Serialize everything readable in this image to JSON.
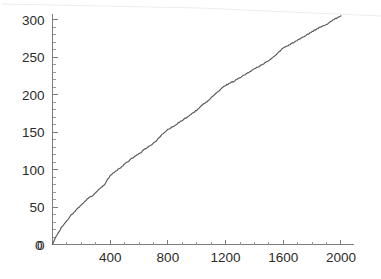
{
  "chart_data": {
    "type": "line",
    "title": "",
    "subtitle": "",
    "xlabel": "",
    "ylabel": "",
    "xlim": [
      0,
      2080
    ],
    "ylim": [
      0,
      318
    ],
    "grid": false,
    "legend": null,
    "xticks": [
      0,
      400,
      800,
      1200,
      1600,
      2000
    ],
    "xtick_labels": [
      "0",
      "400",
      "800",
      "1200",
      "1600",
      "2000"
    ],
    "yticks": [
      0,
      50,
      100,
      150,
      200,
      250,
      300
    ],
    "ytick_labels": [
      "0",
      "50",
      "100",
      "150",
      "200",
      "250",
      "300"
    ],
    "x_minor_tick_interval": 100,
    "y_minor_tick_interval": 10,
    "series": [
      {
        "name": "curve",
        "color": "#575757",
        "x": [
          0,
          20,
          40,
          60,
          80,
          100,
          120,
          140,
          160,
          180,
          200,
          240,
          280,
          320,
          360,
          400,
          440,
          480,
          520,
          560,
          600,
          640,
          680,
          720,
          760,
          800,
          840,
          880,
          920,
          960,
          1000,
          1040,
          1080,
          1120,
          1160,
          1200,
          1240,
          1280,
          1320,
          1360,
          1400,
          1440,
          1480,
          1520,
          1560,
          1600,
          1640,
          1680,
          1720,
          1760,
          1800,
          1840,
          1880,
          1920,
          1960,
          2000
        ],
        "y": [
          0,
          9,
          16,
          22,
          27,
          32,
          37,
          41,
          45,
          49,
          53,
          60,
          66,
          73,
          80,
          92,
          98,
          104,
          110,
          116,
          121,
          127,
          132,
          138,
          147,
          153,
          158,
          163,
          168,
          173,
          179,
          186,
          192,
          199,
          206,
          212,
          216,
          220,
          225,
          229,
          234,
          238,
          243,
          248,
          255,
          262,
          266,
          270,
          275,
          279,
          284,
          288,
          292,
          296,
          301,
          305
        ]
      }
    ]
  },
  "artifact": {
    "name": "scan-line",
    "description": "faint diagonal scanner streak across top of page"
  }
}
